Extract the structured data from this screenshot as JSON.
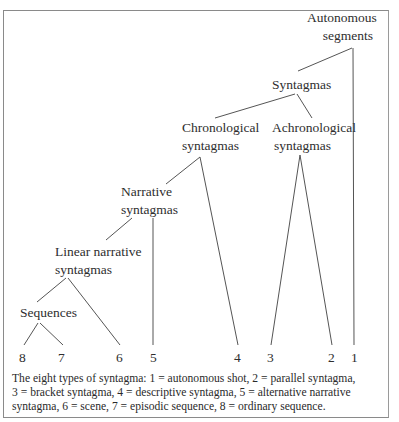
{
  "diagram": {
    "nodes": {
      "autonomous_segments": {
        "line1": "Autonomous",
        "line2": "segments"
      },
      "syntagmas": {
        "line1": "Syntagmas"
      },
      "chronological": {
        "line1": "Chronological",
        "line2": "syntagmas"
      },
      "achronological": {
        "line1": "Achronological",
        "line2": "syntagmas"
      },
      "narrative": {
        "line1": "Narrative",
        "line2": "syntagmas"
      },
      "linear_narrative": {
        "line1": "Linear narrative",
        "line2": "syntagmas"
      },
      "sequences": {
        "line1": "Sequences"
      }
    },
    "leaves": [
      "8",
      "7",
      "6",
      "5",
      "4",
      "3",
      "2",
      "1"
    ],
    "caption": {
      "line1": "The eight types of syntagma: 1 = autonomous shot, 2 = parallel syntagma,",
      "line2": "3 = bracket syntagma, 4 = descriptive syntagma, 5 = alternative narrative",
      "line3": "syntagma, 6 = scene, 7 = episodic sequence, 8 = ordinary sequence."
    },
    "legend": [
      {
        "id": "1",
        "label": "autonomous shot"
      },
      {
        "id": "2",
        "label": "parallel syntagma"
      },
      {
        "id": "3",
        "label": "bracket syntagma"
      },
      {
        "id": "4",
        "label": "descriptive syntagma"
      },
      {
        "id": "5",
        "label": "alternative narrative syntagma"
      },
      {
        "id": "6",
        "label": "scene"
      },
      {
        "id": "7",
        "label": "episodic sequence"
      },
      {
        "id": "8",
        "label": "ordinary sequence"
      }
    ],
    "line_color": "#555555",
    "border_color": "#8a8a8a"
  }
}
